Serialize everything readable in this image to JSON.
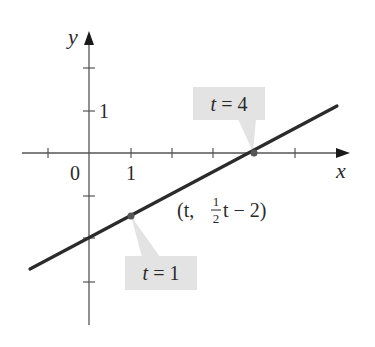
{
  "figure": {
    "type": "parametric-line-plot",
    "axes": {
      "x_label": "x",
      "y_label": "y",
      "origin_label": "0",
      "x_tick_label": "1",
      "y_tick_label": "1"
    },
    "curve": {
      "parametric_label_prefix": "(t, ",
      "frac_num": "1",
      "frac_den": "2",
      "parametric_label_suffix": "t − 2)",
      "equation": "(t, (1/2)t − 2)"
    },
    "callouts": [
      {
        "text": "t = 4",
        "t": 4,
        "point": [
          4,
          0
        ]
      },
      {
        "text": "t = 1",
        "t": 1,
        "point": [
          1,
          -1.5
        ]
      }
    ],
    "colors": {
      "line": "#2b2b2b",
      "axis": "#555555",
      "callout_bg": "#e3e3e3",
      "point": "#555555"
    }
  },
  "chart_data": {
    "type": "line",
    "title": "",
    "xlabel": "x",
    "ylabel": "y",
    "xlim": [
      -1.6,
      6.2
    ],
    "ylim": [
      -4.1,
      2.9
    ],
    "grid": false,
    "series": [
      {
        "name": "(t, 1/2 t - 2)",
        "x": [
          -1.4,
          6.0
        ],
        "y": [
          -2.7,
          1.0
        ]
      }
    ],
    "x_ticks": [
      -1,
      0,
      1,
      2,
      3,
      4,
      5
    ],
    "y_ticks": [
      -3,
      -2,
      -1,
      0,
      1,
      2
    ],
    "tick_labels_shown": {
      "x": [
        "0",
        "1"
      ],
      "y": [
        "1"
      ]
    },
    "annotations": [
      {
        "text": "t = 4",
        "x": 4,
        "y": 0
      },
      {
        "text": "t = 1",
        "x": 1,
        "y": -1.5
      },
      {
        "text": "(t, ½t − 2)",
        "x": 2.5,
        "y": -0.75
      }
    ]
  }
}
